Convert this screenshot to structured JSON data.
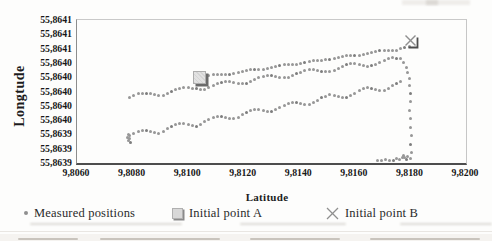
{
  "figure": {
    "ylabel": "Longtude",
    "xlabel": "Latitude"
  },
  "legend": {
    "items": [
      {
        "label": "Measured positions",
        "marker": "gray-dot"
      },
      {
        "label": "Initial point A",
        "marker": "gray-shadowed-square"
      },
      {
        "label": "Initial point B",
        "marker": "gray-cross"
      }
    ]
  },
  "chart_data": {
    "type": "scatter",
    "title": "",
    "xlabel": "Latitude",
    "ylabel": "Longtude",
    "xlim": [
      9.806,
      9.82
    ],
    "ylim": [
      55.8639,
      55.8641
    ],
    "grid": false,
    "legend_position": "bottom",
    "x_ticks": [
      {
        "value": 9.806,
        "label": "9,8060"
      },
      {
        "value": 9.808,
        "label": "9,8080"
      },
      {
        "value": 9.81,
        "label": "9,8100"
      },
      {
        "value": 9.812,
        "label": "9,8120"
      },
      {
        "value": 9.814,
        "label": "9,8140"
      },
      {
        "value": 9.816,
        "label": "9,8160"
      },
      {
        "value": 9.818,
        "label": "9,8180"
      },
      {
        "value": 9.82,
        "label": "9,8200"
      }
    ],
    "y_ticks": [
      {
        "value": 55.8641,
        "label": "55,8641"
      },
      {
        "value": 55.86408,
        "label": "55,8641"
      },
      {
        "value": 55.86406,
        "label": "55,8641"
      },
      {
        "value": 55.86404,
        "label": "55,8640"
      },
      {
        "value": 55.86402,
        "label": "55,8640"
      },
      {
        "value": 55.864,
        "label": "55,8640"
      },
      {
        "value": 55.86398,
        "label": "55,8640"
      },
      {
        "value": 55.86396,
        "label": "55,8640"
      },
      {
        "value": 55.86394,
        "label": "55,8639"
      },
      {
        "value": 55.86392,
        "label": "55,8639"
      },
      {
        "value": 55.8639,
        "label": "55,8639"
      }
    ],
    "lon_base": 55.864,
    "lon_unit": 1e-06,
    "series": [
      {
        "name": "Measured positions",
        "marker_color": "#979797",
        "segments": [
          {
            "lat0": 9.8106,
            "dlat": 0.00015,
            "lon_micro": [
              20,
              21.7,
              23.1,
              23.4,
              23.4,
              23.5,
              23.7,
              25.2,
              26.9,
              28.5,
              30,
              30.2,
              30.3,
              30.3,
              30.6,
              32.1,
              33.7,
              35.4,
              36.8,
              37.1,
              37.1,
              37.2,
              37.5,
              38.9,
              40.6,
              42.2,
              43.7,
              43.9,
              44,
              44.1,
              44.3,
              45.8,
              47.4,
              49.1,
              50.5,
              50.8,
              50.9,
              50.9,
              51.2,
              52.6,
              54.3,
              55.9,
              57.4,
              57.7,
              57.7,
              57.8,
              58,
              59.5,
              61.1,
              62.8
            ]
          },
          {
            "lat0": 9.8079,
            "dlat": 0.00015,
            "lon_micro": [
              -8,
              -5.4,
              -3.4,
              -2.1,
              -2.2,
              -3.4,
              -4.6,
              -5.3,
              -5,
              -2.7,
              0.2,
              2.8,
              4.8,
              6.1,
              5.9,
              4.7,
              3.5,
              2.9,
              3.2,
              5.5,
              8.3,
              10.9,
              12.9,
              14.2,
              14.1,
              12.9,
              11.7,
              11,
              11.3,
              13.6,
              16.5,
              19.1,
              21.1,
              22.4,
              22.2,
              21,
              19.8,
              19.2,
              19.5,
              21.8,
              24.6,
              27.2,
              29.2,
              30.5,
              30.4,
              29.2,
              28,
              27.3,
              27.6,
              29.9,
              32.8,
              35.4,
              37.4,
              38.7,
              38.5,
              37.3,
              36.2,
              35.5,
              35.8,
              38.1,
              40.9,
              43.5,
              45.5,
              46.9,
              46.7,
              45.5
            ]
          },
          {
            "lat0": 9.8079,
            "dlat": 0.00015,
            "lon_micro": [
              -62,
              -58.9,
              -56.3,
              -54.7,
              -55.1,
              -56.5,
              -57.9,
              -58.2,
              -55.6,
              -52,
              -48.9,
              -46.3,
              -44.7,
              -45.1,
              -46.5,
              -47.9,
              -48.3,
              -45.7,
              -42.1,
              -38.9,
              -36.3,
              -34.7,
              -35.1,
              -36.5,
              -37.9,
              -38.3,
              -35.7,
              -32.1,
              -29,
              -26.4,
              -24.8,
              -25.2,
              -26.5,
              -27.9,
              -28.3,
              -25.7,
              -22.1,
              -19,
              -16.4,
              -14.8,
              -15.2,
              -16.6,
              -18,
              -18.4,
              -15.8,
              -12.1,
              -9,
              -6.4,
              -4.8,
              -5.2,
              -6.6,
              -8,
              -8.4,
              -5.8,
              -2.2,
              0.9,
              3.6,
              5.2,
              4.8,
              3.4,
              2,
              1.6,
              4.2,
              7.8,
              10.9,
              13.5
            ]
          }
        ],
        "start_cluster": [
          [
            9.80782,
            -64
          ],
          [
            9.80785,
            -68
          ],
          [
            9.80787,
            -60
          ],
          [
            9.80789,
            -66
          ],
          [
            9.80791,
            -71
          ]
        ],
        "right_descent": [
          [
            9.81775,
            40
          ],
          [
            9.81785,
            33
          ],
          [
            9.8179,
            26
          ],
          [
            9.81795,
            18
          ],
          [
            9.81795,
            8
          ],
          [
            9.818,
            -3
          ],
          [
            9.818,
            -14
          ],
          [
            9.81795,
            -27
          ],
          [
            9.818,
            -38
          ],
          [
            9.818,
            -50
          ],
          [
            9.81805,
            -62
          ],
          [
            9.818,
            -74
          ],
          [
            9.81805,
            -85
          ]
        ],
        "bottom_run": [
          [
            9.8168,
            -96
          ],
          [
            9.81695,
            -97
          ],
          [
            9.8171,
            -95
          ],
          [
            9.81725,
            -96
          ],
          [
            9.8174,
            -97
          ],
          [
            9.8175,
            -94
          ],
          [
            9.8176,
            -95
          ],
          [
            9.8177,
            -92
          ],
          [
            9.81775,
            -90
          ],
          [
            9.8178,
            -93
          ],
          [
            9.81785,
            -95
          ],
          [
            9.8179,
            -91
          ],
          [
            9.818,
            -94
          ]
        ]
      }
    ],
    "markers": [
      {
        "name": "Initial point A",
        "lat": 9.8104,
        "lon_micro": 19,
        "shape": "square"
      },
      {
        "name": "Initial point B",
        "lat": 9.818,
        "lon_micro": 72,
        "shape": "cross"
      }
    ]
  }
}
